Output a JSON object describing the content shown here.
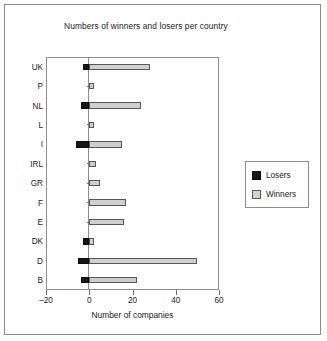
{
  "chart_data": {
    "type": "bar",
    "orientation": "horizontal",
    "title": "Numbers of winners and losers per country",
    "xlabel": "Number of companies",
    "ylabel": "",
    "xlim": [
      -20,
      60
    ],
    "xticks": [
      -20,
      0,
      20,
      40,
      60
    ],
    "xtick_labels": [
      "–20",
      "0",
      "20",
      "40",
      "60"
    ],
    "grid": false,
    "legend_position": "right",
    "categories": [
      "UK",
      "P",
      "NL",
      "L",
      "I",
      "IRL",
      "GR",
      "F",
      "E",
      "DK",
      "D",
      "B"
    ],
    "series": [
      {
        "name": "Losers",
        "color": "#171717",
        "values": [
          -3,
          0,
          -4,
          0,
          -6,
          0,
          0,
          0,
          0,
          -3,
          -5,
          -4
        ]
      },
      {
        "name": "Winners",
        "color": "#cfcfcf",
        "values": [
          28,
          2,
          24,
          2,
          15,
          3,
          5,
          17,
          16,
          2,
          50,
          22
        ]
      }
    ]
  },
  "legend": {
    "entries": [
      {
        "label": "Losers",
        "swatch": "losers"
      },
      {
        "label": "Winners",
        "swatch": "winners"
      }
    ]
  }
}
